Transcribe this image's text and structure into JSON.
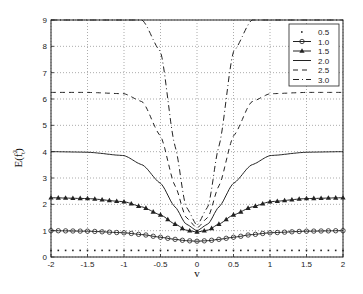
{
  "chart_data": {
    "type": "line",
    "title": "",
    "xlabel": "v",
    "ylabel": "E(f_t^2)",
    "xlim": [
      -2,
      2
    ],
    "ylim": [
      0,
      9
    ],
    "grid": true,
    "legend_position": "upper right",
    "x_ticks": [
      "-2",
      "-1.5",
      "-1",
      "-0.5",
      "0",
      "0.5",
      "1",
      "1.5",
      "2"
    ],
    "y_ticks": [
      "0",
      "1",
      "2",
      "3",
      "4",
      "5",
      "6",
      "7",
      "8",
      "9"
    ],
    "x": [
      -2,
      -1.5,
      -1,
      -0.75,
      -0.5,
      -0.3,
      -0.15,
      0,
      0.15,
      0.3,
      0.5,
      0.75,
      1,
      1.5,
      2
    ],
    "series": [
      {
        "name": "0.5",
        "style": "dotted",
        "values": [
          0.25,
          0.25,
          0.25,
          0.25,
          0.25,
          0.25,
          0.25,
          0.25,
          0.25,
          0.25,
          0.25,
          0.25,
          0.25,
          0.25,
          0.25
        ]
      },
      {
        "name": "1.0",
        "style": "line-circle",
        "values": [
          1.0,
          0.98,
          0.92,
          0.85,
          0.75,
          0.67,
          0.62,
          0.6,
          0.62,
          0.67,
          0.75,
          0.85,
          0.92,
          0.98,
          1.0
        ]
      },
      {
        "name": "1.5",
        "style": "line-triangle",
        "values": [
          2.25,
          2.22,
          2.1,
          1.9,
          1.6,
          1.25,
          1.02,
          0.95,
          1.02,
          1.25,
          1.6,
          1.9,
          2.1,
          2.22,
          2.25
        ]
      },
      {
        "name": "2.0",
        "style": "solid",
        "values": [
          4.0,
          3.98,
          3.85,
          3.5,
          2.8,
          1.9,
          1.25,
          1.0,
          1.25,
          1.9,
          2.8,
          3.5,
          3.85,
          3.98,
          4.0
        ]
      },
      {
        "name": "2.5",
        "style": "dashed",
        "values": [
          6.25,
          6.25,
          6.2,
          5.9,
          4.6,
          2.7,
          1.5,
          1.1,
          1.5,
          2.7,
          4.6,
          5.9,
          6.2,
          6.25,
          6.25
        ]
      },
      {
        "name": "3.0",
        "style": "dash-dot",
        "values": [
          9.0,
          9.0,
          9.0,
          9.0,
          7.8,
          4.2,
          1.9,
          1.2,
          1.9,
          4.2,
          7.8,
          9.0,
          9.0,
          9.0,
          9.0
        ]
      }
    ]
  },
  "legend": {
    "items": [
      "0.5",
      "1.0",
      "1.5",
      "2.0",
      "2.5",
      "3.0"
    ]
  },
  "axes": {
    "xlabel": "v",
    "ylabel_main": "E(f",
    "ylabel_sup": "2",
    "ylabel_sub": "t",
    "ylabel_close": ")"
  }
}
